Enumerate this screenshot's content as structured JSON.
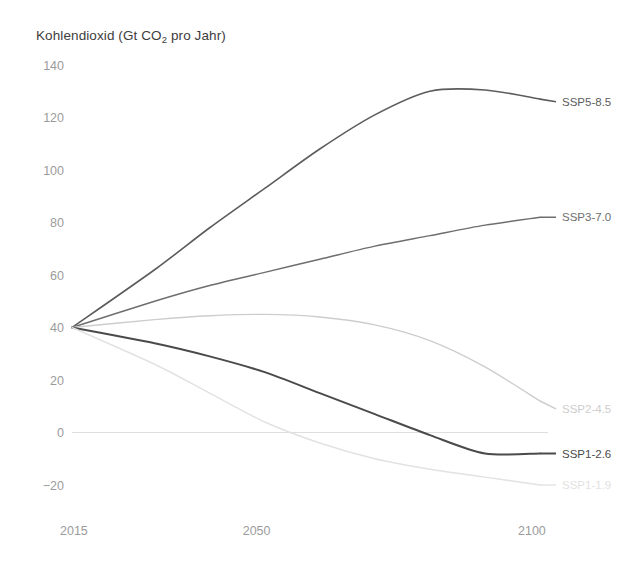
{
  "chart_data": {
    "type": "line",
    "title": "Kohlendioxid (Gt CO2 pro Jahr)",
    "title_parts": {
      "before": "Kohlendioxid (Gt CO",
      "sub": "2",
      "after": " pro Jahr)"
    },
    "xlabel": "",
    "ylabel": "Kohlendioxid (Gt CO2 pro Jahr)",
    "xlim": [
      2015,
      2100
    ],
    "ylim": [
      -20,
      140
    ],
    "yticks": [
      140,
      120,
      100,
      80,
      60,
      40,
      20,
      0,
      -20
    ],
    "ytick_labels": [
      "140",
      "120",
      "100",
      "80",
      "60",
      "40",
      "20",
      "0",
      "−20"
    ],
    "xticks": [
      2015,
      2050,
      2100
    ],
    "xtick_labels": [
      "2015",
      "2050",
      "2100"
    ],
    "grid": false,
    "zero_line": true,
    "legend_position": "right-inline",
    "x": [
      2015,
      2030,
      2040,
      2050,
      2060,
      2070,
      2080,
      2090,
      2100
    ],
    "series": [
      {
        "name": "SSP5-8.5",
        "label": "SSP5-8.5",
        "color": "#5c5c5c",
        "width": 1.6,
        "label_y_value": 126,
        "values": [
          40,
          62,
          78,
          93,
          108,
          121,
          130,
          130.5,
          127
        ]
      },
      {
        "name": "SSP3-7.0",
        "label": "SSP3-7.0",
        "color": "#6e6e6e",
        "width": 1.5,
        "label_y_value": 82,
        "values": [
          40,
          50,
          56,
          61,
          66,
          71,
          75,
          79,
          82
        ]
      },
      {
        "name": "SSP2-4.5",
        "label": "SSP2-4.5",
        "color": "#cdcdcd",
        "width": 1.4,
        "label_y_value": 9,
        "values": [
          40,
          43,
          44.5,
          45,
          44,
          41,
          35,
          25,
          12
        ]
      },
      {
        "name": "SSP1-2.6",
        "label": "SSP1-2.6",
        "color": "#4a4a4a",
        "width": 2.0,
        "label_y_value": -8,
        "values": [
          40,
          34,
          29,
          23,
          15,
          7,
          -1,
          -8,
          -8
        ]
      },
      {
        "name": "SSP1-1.9",
        "label": "SSP1-1.9",
        "color": "#e2e2e2",
        "width": 1.4,
        "label_y_value": -20,
        "values": [
          40,
          26,
          15,
          4,
          -4,
          -10,
          -14,
          -17,
          -20
        ]
      }
    ]
  },
  "axis_style": {
    "tick_color": "#9b9b9b",
    "zero_line_color": "#dedede",
    "background": "#ffffff"
  }
}
